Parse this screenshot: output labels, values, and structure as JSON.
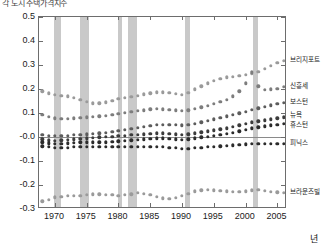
{
  "title": "각 도시 주택가격지수",
  "axes": {
    "x_label": "년",
    "x_ticks": [
      "1970",
      "1975",
      "1980",
      "1985",
      "1990",
      "1995",
      "2000",
      "2005"
    ],
    "x_tick_values": [
      1970,
      1975,
      1980,
      1985,
      1990,
      1995,
      2000,
      2005
    ],
    "x_range": [
      1967.5,
      2006.5
    ],
    "y_ticks": [
      "0.5",
      "0.4",
      "0.3",
      "0.2",
      "0.1",
      "-0.0",
      "-0.1",
      "-0.2",
      "-0.3"
    ],
    "y_tick_values": [
      0.5,
      0.4,
      0.3,
      0.2,
      0.1,
      0.0,
      -0.1,
      -0.2,
      -0.3
    ],
    "y_range": [
      -0.3,
      0.5
    ]
  },
  "colors": {
    "band": "#c9c9c9",
    "axis": "#6d6d6d",
    "series_light": "#9a9a9a",
    "series_mid": "#7d7d7d",
    "series_dark": "#3b3b3b",
    "series_darkest": "#2b2b2b",
    "background": "#ffffff"
  },
  "recession_bands": [
    {
      "start": 1969.9,
      "end": 1970.9
    },
    {
      "start": 1973.9,
      "end": 1975.3
    },
    {
      "start": 1980.0,
      "end": 1980.6
    },
    {
      "start": 1981.5,
      "end": 1982.9
    },
    {
      "start": 1990.5,
      "end": 1991.2
    },
    {
      "start": 2001.2,
      "end": 2001.9
    }
  ],
  "chart_data": {
    "type": "scatter",
    "title": "각 도시 주택가격지수",
    "xlabel": "년",
    "ylabel": "",
    "xlim": [
      1967.5,
      2006.5
    ],
    "ylim": [
      -0.3,
      0.5
    ],
    "grid": false,
    "legend_position": "right",
    "x": [
      1968,
      1969,
      1970,
      1971,
      1972,
      1973,
      1974,
      1975,
      1976,
      1977,
      1978,
      1979,
      1980,
      1981,
      1982,
      1983,
      1984,
      1985,
      1986,
      1987,
      1988,
      1989,
      1990,
      1991,
      1992,
      1993,
      1994,
      1995,
      1996,
      1997,
      1998,
      1999,
      2000,
      2001,
      2002,
      2003,
      2004,
      2005,
      2006
    ],
    "series": [
      {
        "name": "브리지포트",
        "color": "#9a9a9a",
        "values": [
          0.19,
          0.182,
          0.176,
          0.172,
          0.17,
          0.164,
          0.154,
          0.146,
          0.14,
          0.141,
          0.145,
          0.152,
          0.158,
          0.163,
          0.168,
          0.172,
          0.178,
          0.182,
          0.186,
          0.186,
          0.184,
          0.18,
          0.176,
          0.184,
          0.198,
          0.212,
          0.224,
          0.234,
          0.242,
          0.248,
          0.252,
          0.254,
          0.258,
          0.264,
          0.272,
          0.284,
          0.296,
          0.308,
          0.318
        ]
      },
      {
        "name": "신흥세",
        "color": "#7d7d7d",
        "values": [
          0.092,
          0.084,
          0.078,
          0.076,
          0.076,
          0.078,
          0.08,
          0.082,
          0.084,
          0.086,
          0.088,
          0.092,
          0.096,
          0.1,
          0.104,
          0.108,
          0.112,
          0.116,
          0.118,
          0.116,
          0.114,
          0.112,
          0.11,
          0.112,
          0.118,
          0.124,
          0.13,
          0.138,
          0.146,
          0.156,
          0.17,
          0.19,
          0.224,
          0.27,
          0.212,
          0.196,
          0.198,
          0.202,
          0.208
        ]
      },
      {
        "name": "보스턴",
        "color": "#5c5c5c",
        "values": [
          0.01,
          0.006,
          0.004,
          0.004,
          0.006,
          0.008,
          0.01,
          0.012,
          0.014,
          0.016,
          0.018,
          0.022,
          0.026,
          0.03,
          0.034,
          0.038,
          0.042,
          0.046,
          0.05,
          0.052,
          0.052,
          0.05,
          0.048,
          0.05,
          0.056,
          0.062,
          0.068,
          0.074,
          0.08,
          0.086,
          0.092,
          0.098,
          0.106,
          0.114,
          0.12,
          0.126,
          0.132,
          0.138,
          0.142
        ]
      },
      {
        "name": "뉴욕",
        "color": "#3b3b3b",
        "values": [
          -0.01,
          -0.014,
          -0.016,
          -0.014,
          -0.012,
          -0.01,
          -0.008,
          -0.006,
          -0.004,
          -0.002,
          0.0,
          0.002,
          0.004,
          0.006,
          0.008,
          0.01,
          0.012,
          0.014,
          0.016,
          0.016,
          0.014,
          0.012,
          0.01,
          0.012,
          0.016,
          0.02,
          0.024,
          0.028,
          0.032,
          0.036,
          0.042,
          0.048,
          0.056,
          0.062,
          0.066,
          0.07,
          0.074,
          0.078,
          0.082
        ]
      },
      {
        "name": "휴스턴",
        "color": "#2b2b2b",
        "values": [
          -0.022,
          -0.026,
          -0.028,
          -0.028,
          -0.026,
          -0.024,
          -0.022,
          -0.022,
          -0.022,
          -0.022,
          -0.022,
          -0.02,
          -0.018,
          -0.016,
          -0.014,
          -0.012,
          -0.01,
          -0.008,
          -0.006,
          -0.006,
          -0.008,
          -0.01,
          -0.012,
          -0.01,
          -0.006,
          -0.002,
          0.002,
          0.006,
          0.01,
          0.014,
          0.018,
          0.024,
          0.03,
          0.036,
          0.04,
          0.044,
          0.048,
          0.052,
          0.056
        ]
      },
      {
        "name": "피닉스",
        "color": "#2b2b2b",
        "values": [
          -0.038,
          -0.042,
          -0.046,
          -0.046,
          -0.044,
          -0.042,
          -0.04,
          -0.04,
          -0.04,
          -0.04,
          -0.04,
          -0.04,
          -0.04,
          -0.04,
          -0.04,
          -0.04,
          -0.04,
          -0.04,
          -0.04,
          -0.042,
          -0.044,
          -0.046,
          -0.048,
          -0.048,
          -0.046,
          -0.044,
          -0.042,
          -0.04,
          -0.038,
          -0.036,
          -0.034,
          -0.032,
          -0.03,
          -0.028,
          -0.028,
          -0.028,
          -0.028,
          -0.028,
          -0.028
        ]
      },
      {
        "name": "브라운즈빌",
        "color": "#9a9a9a",
        "values": [
          -0.268,
          -0.262,
          -0.252,
          -0.248,
          -0.246,
          -0.246,
          -0.244,
          -0.24,
          -0.238,
          -0.238,
          -0.24,
          -0.242,
          -0.244,
          -0.242,
          -0.238,
          -0.232,
          -0.236,
          -0.242,
          -0.25,
          -0.256,
          -0.258,
          -0.254,
          -0.246,
          -0.236,
          -0.226,
          -0.222,
          -0.22,
          -0.222,
          -0.224,
          -0.226,
          -0.228,
          -0.228,
          -0.226,
          -0.222,
          -0.22,
          -0.224,
          -0.228,
          -0.23,
          -0.232
        ]
      }
    ]
  },
  "legend_labels": [
    {
      "text": "브리지포트",
      "value": 0.318
    },
    {
      "text": "신흥세",
      "value": 0.208
    },
    {
      "text": "보스턴",
      "value": 0.142
    },
    {
      "text": "뉴욕",
      "value": 0.082
    },
    {
      "text": "휴스턴",
      "value": 0.056
    },
    {
      "text": "피닉스",
      "value": -0.028
    },
    {
      "text": "브라운즈빌",
      "value": -0.232
    }
  ]
}
